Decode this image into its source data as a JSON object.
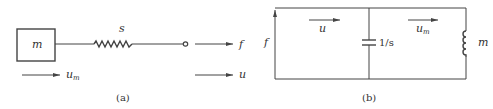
{
  "figure_a": {
    "caption": "(a)",
    "mass_label": "m",
    "spring_label": "s",
    "force_label": "f",
    "mass_velocity_label": "u",
    "mass_velocity_sub": "m",
    "terminal_velocity_label": "u"
  },
  "figure_b": {
    "caption": "(b)",
    "source_label": "f",
    "current_left_label": "u",
    "current_right_label": "u",
    "current_right_sub": "m",
    "capacitor_label": "1/s",
    "inductor_label": "m"
  },
  "colors": {
    "line": "#444444",
    "text": "#333333",
    "background": "#ffffff"
  }
}
